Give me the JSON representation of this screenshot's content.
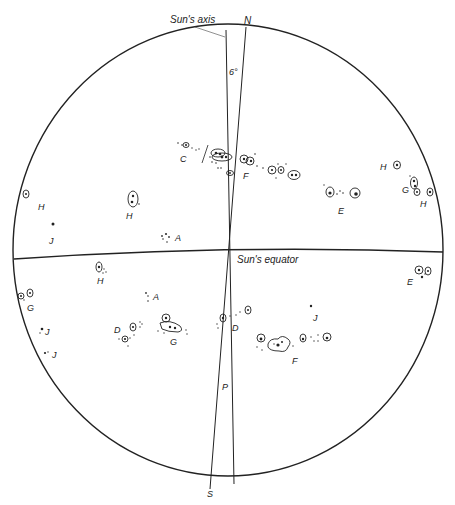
{
  "diagram": {
    "title_labels": {
      "suns_axis": "Sun's axis",
      "north": "N",
      "south": "S",
      "angle": "6°",
      "p": "P",
      "suns_equator": "Sun's equator"
    },
    "colors": {
      "ink": "#222222",
      "background": "#ffffff"
    },
    "disk": {
      "cx": 228,
      "cy": 250,
      "rx": 215,
      "ry": 226
    },
    "spot_labels": [
      {
        "id": "C",
        "text": "C",
        "x": 180,
        "y": 155
      },
      {
        "id": "F-north",
        "text": "F",
        "x": 243,
        "y": 172
      },
      {
        "id": "H-ne1",
        "text": "H",
        "x": 380,
        "y": 165
      },
      {
        "id": "G-ne",
        "text": "G",
        "x": 402,
        "y": 186
      },
      {
        "id": "H-ne2",
        "text": "H",
        "x": 420,
        "y": 200
      },
      {
        "id": "E-north",
        "text": "E",
        "x": 338,
        "y": 207
      },
      {
        "id": "H-nw1",
        "text": "H",
        "x": 38,
        "y": 203
      },
      {
        "id": "H-nw2",
        "text": "H",
        "x": 126,
        "y": 212
      },
      {
        "id": "J-nw",
        "text": "J",
        "x": 49,
        "y": 237
      },
      {
        "id": "A-north",
        "text": "A",
        "x": 175,
        "y": 235
      },
      {
        "id": "H-sw",
        "text": "H",
        "x": 97,
        "y": 277
      },
      {
        "id": "E-south",
        "text": "E",
        "x": 407,
        "y": 278
      },
      {
        "id": "G-sw",
        "text": "G",
        "x": 27,
        "y": 305
      },
      {
        "id": "A-south",
        "text": "A",
        "x": 153,
        "y": 295
      },
      {
        "id": "J-sw1",
        "text": "J",
        "x": 45,
        "y": 330
      },
      {
        "id": "J-sw2",
        "text": "J",
        "x": 52,
        "y": 352
      },
      {
        "id": "D-left",
        "text": "D",
        "x": 114,
        "y": 328
      },
      {
        "id": "G-south",
        "text": "G",
        "x": 170,
        "y": 340
      },
      {
        "id": "D-center",
        "text": "D",
        "x": 232,
        "y": 325
      },
      {
        "id": "J-se",
        "text": "J",
        "x": 313,
        "y": 316
      },
      {
        "id": "F-south",
        "text": "F",
        "x": 292,
        "y": 358
      }
    ]
  }
}
